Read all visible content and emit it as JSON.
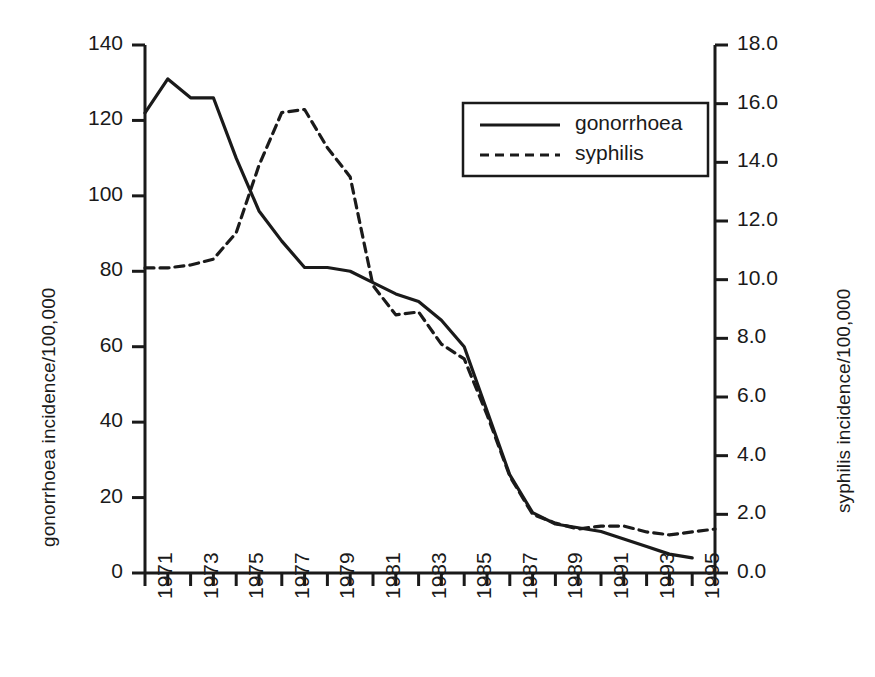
{
  "chart_data": {
    "type": "line",
    "title": "",
    "xlabel": "",
    "ylabel": "gonorrhoea incidence/100,000",
    "ylabel_right": "syphilis incidence/100,000",
    "grid": false,
    "legend_position": "upper-right",
    "x": [
      1971,
      1972,
      1973,
      1974,
      1975,
      1976,
      1977,
      1978,
      1979,
      1980,
      1981,
      1982,
      1983,
      1984,
      1985,
      1986,
      1987,
      1988,
      1989,
      1990,
      1991,
      1992,
      1993,
      1994,
      1995,
      1996
    ],
    "xlim": [
      1971,
      1996
    ],
    "xticks": [
      1971,
      1972,
      1973,
      1974,
      1975,
      1976,
      1977,
      1978,
      1979,
      1980,
      1981,
      1982,
      1983,
      1984,
      1985,
      1986,
      1987,
      1988,
      1989,
      1990,
      1991,
      1992,
      1993,
      1994,
      1995,
      1996
    ],
    "xtick_labels": [
      "1971",
      "",
      "1973",
      "",
      "1975",
      "",
      "1977",
      "",
      "1979",
      "",
      "1981",
      "",
      "1983",
      "",
      "1985",
      "",
      "1987",
      "",
      "1989",
      "",
      "1991",
      "",
      "1993",
      "",
      "1995",
      ""
    ],
    "ylim": [
      0,
      140
    ],
    "yticks": [
      0,
      20,
      40,
      60,
      80,
      100,
      120,
      140
    ],
    "ytick_labels": [
      "0",
      "20",
      "40",
      "60",
      "80",
      "100",
      "120",
      "140"
    ],
    "ylim_right": [
      0.0,
      18.0
    ],
    "yticks_right": [
      0.0,
      2.0,
      4.0,
      6.0,
      8.0,
      10.0,
      12.0,
      14.0,
      16.0,
      18.0
    ],
    "ytick_labels_right": [
      "0.0",
      "2.0",
      "4.0",
      "6.0",
      "8.0",
      "10.0",
      "12.0",
      "14.0",
      "16.0",
      "18.0"
    ],
    "series": [
      {
        "name": "gonorrhoea",
        "axis": "left",
        "style": "solid",
        "color": "#1a1a1a",
        "x": [
          1971,
          1972,
          1973,
          1974,
          1975,
          1976,
          1977,
          1978,
          1979,
          1980,
          1981,
          1982,
          1983,
          1984,
          1985,
          1986,
          1987,
          1988,
          1989,
          1990,
          1991,
          1992,
          1993,
          1994,
          1995
        ],
        "values": [
          122,
          131,
          126,
          126,
          110,
          96,
          88,
          81,
          81,
          80,
          77,
          74,
          72,
          67,
          60,
          43,
          26,
          16,
          13,
          12,
          11,
          9,
          7,
          5,
          4
        ]
      },
      {
        "name": "syphilis",
        "axis": "right",
        "style": "dashed",
        "color": "#1a1a1a",
        "x": [
          1971,
          1972,
          1973,
          1974,
          1975,
          1976,
          1977,
          1978,
          1979,
          1980,
          1981,
          1982,
          1983,
          1984,
          1985,
          1986,
          1987,
          1988,
          1989,
          1990,
          1991,
          1992,
          1993,
          1994,
          1995,
          1996
        ],
        "values": [
          10.4,
          10.4,
          10.5,
          10.7,
          11.6,
          13.9,
          15.7,
          15.8,
          14.5,
          13.5,
          9.8,
          8.8,
          8.9,
          7.8,
          7.3,
          5.4,
          3.3,
          2.0,
          1.7,
          1.5,
          1.6,
          1.6,
          1.4,
          1.3,
          1.4,
          1.5
        ]
      }
    ]
  },
  "legend": {
    "items": [
      {
        "label": "gonorrhoea",
        "style": "solid"
      },
      {
        "label": "syphilis",
        "style": "dashed"
      }
    ]
  }
}
